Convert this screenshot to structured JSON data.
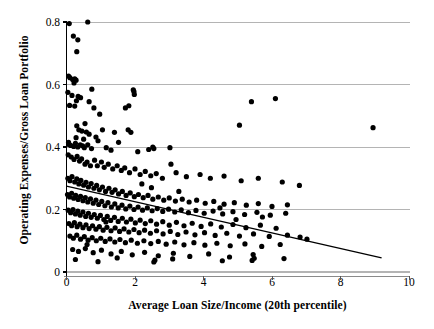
{
  "chart_data": {
    "type": "scatter",
    "title": "",
    "xlabel": "Average Loan Size/Income (20th percentile)",
    "ylabel": "Operating Expenses/Gross Loan Portfolio",
    "xlim": [
      0,
      10
    ],
    "ylim": [
      0,
      0.8
    ],
    "xticks": [
      0,
      2,
      4,
      6,
      8,
      10
    ],
    "xtick_labels": [
      "0",
      "2",
      "4",
      "6",
      "8",
      "10"
    ],
    "yticks": [
      0,
      0.2,
      0.4,
      0.6,
      0.8
    ],
    "ytick_labels": [
      "0",
      "0.2",
      "0.4",
      "0.6",
      "0.8"
    ],
    "grid": "horizontal",
    "grid_color": "#b4b4b4",
    "axis_color": "#000000",
    "marker_color": "#000000",
    "marker_size": 2.6,
    "legend": null,
    "trendline": {
      "label": "linear fit",
      "color": "#000000",
      "x_start": 0.0,
      "y_start": 0.275,
      "x_end": 9.2,
      "y_end": 0.045
    },
    "points": [
      [
        0.08,
        0.795
      ],
      [
        0.62,
        0.8
      ],
      [
        0.2,
        0.755
      ],
      [
        0.33,
        0.743
      ],
      [
        0.3,
        0.705
      ],
      [
        0.06,
        0.627
      ],
      [
        0.1,
        0.622
      ],
      [
        0.18,
        0.616
      ],
      [
        0.24,
        0.618
      ],
      [
        0.28,
        0.614
      ],
      [
        0.22,
        0.605
      ],
      [
        0.04,
        0.575
      ],
      [
        0.16,
        0.565
      ],
      [
        0.34,
        0.562
      ],
      [
        0.41,
        0.558
      ],
      [
        0.29,
        0.548
      ],
      [
        0.09,
        0.533
      ],
      [
        0.24,
        0.531
      ],
      [
        0.74,
        0.585
      ],
      [
        1.95,
        0.583
      ],
      [
        1.97,
        0.577
      ],
      [
        1.98,
        0.568
      ],
      [
        0.66,
        0.545
      ],
      [
        0.8,
        0.525
      ],
      [
        1.72,
        0.525
      ],
      [
        1.82,
        0.532
      ],
      [
        0.97,
        0.505
      ],
      [
        0.54,
        0.475
      ],
      [
        0.3,
        0.468
      ],
      [
        0.36,
        0.455
      ],
      [
        0.45,
        0.451
      ],
      [
        0.58,
        0.448
      ],
      [
        0.66,
        0.441
      ],
      [
        0.86,
        0.432
      ],
      [
        0.28,
        0.43
      ],
      [
        0.5,
        0.425
      ],
      [
        1.05,
        0.455
      ],
      [
        1.4,
        0.447
      ],
      [
        1.8,
        0.455
      ],
      [
        1.88,
        0.447
      ],
      [
        0.06,
        0.415
      ],
      [
        0.07,
        0.408
      ],
      [
        0.12,
        0.405
      ],
      [
        0.21,
        0.402
      ],
      [
        0.26,
        0.412
      ],
      [
        0.33,
        0.4
      ],
      [
        0.4,
        0.407
      ],
      [
        0.47,
        0.404
      ],
      [
        0.52,
        0.398
      ],
      [
        0.62,
        0.407
      ],
      [
        0.73,
        0.395
      ],
      [
        0.92,
        0.42
      ],
      [
        1.16,
        0.398
      ],
      [
        1.3,
        0.39
      ],
      [
        1.52,
        0.415
      ],
      [
        2.08,
        0.385
      ],
      [
        2.4,
        0.392
      ],
      [
        2.52,
        0.4
      ],
      [
        2.55,
        0.395
      ],
      [
        3.02,
        0.398
      ],
      [
        3.05,
        0.345
      ],
      [
        5.05,
        0.47
      ],
      [
        5.4,
        0.545
      ],
      [
        6.1,
        0.555
      ],
      [
        8.95,
        0.462
      ],
      [
        0.05,
        0.375
      ],
      [
        0.14,
        0.368
      ],
      [
        0.22,
        0.36
      ],
      [
        0.31,
        0.37
      ],
      [
        0.38,
        0.355
      ],
      [
        0.44,
        0.362
      ],
      [
        0.54,
        0.345
      ],
      [
        0.6,
        0.352
      ],
      [
        0.7,
        0.34
      ],
      [
        0.82,
        0.358
      ],
      [
        0.9,
        0.34
      ],
      [
        1.02,
        0.352
      ],
      [
        1.1,
        0.335
      ],
      [
        1.22,
        0.345
      ],
      [
        1.35,
        0.33
      ],
      [
        1.48,
        0.34
      ],
      [
        1.6,
        0.325
      ],
      [
        1.7,
        0.333
      ],
      [
        1.84,
        0.318
      ],
      [
        2.0,
        0.33
      ],
      [
        2.15,
        0.312
      ],
      [
        2.3,
        0.322
      ],
      [
        2.46,
        0.308
      ],
      [
        2.62,
        0.315
      ],
      [
        2.8,
        0.3
      ],
      [
        3.2,
        0.318
      ],
      [
        3.5,
        0.305
      ],
      [
        3.9,
        0.312
      ],
      [
        4.2,
        0.3
      ],
      [
        4.6,
        0.307
      ],
      [
        5.1,
        0.292
      ],
      [
        5.6,
        0.3
      ],
      [
        6.3,
        0.288
      ],
      [
        6.8,
        0.277
      ],
      [
        0.04,
        0.3
      ],
      [
        0.1,
        0.292
      ],
      [
        0.16,
        0.305
      ],
      [
        0.24,
        0.288
      ],
      [
        0.3,
        0.298
      ],
      [
        0.36,
        0.282
      ],
      [
        0.42,
        0.293
      ],
      [
        0.5,
        0.278
      ],
      [
        0.57,
        0.287
      ],
      [
        0.64,
        0.272
      ],
      [
        0.72,
        0.283
      ],
      [
        0.8,
        0.268
      ],
      [
        0.88,
        0.277
      ],
      [
        0.96,
        0.263
      ],
      [
        1.05,
        0.272
      ],
      [
        1.14,
        0.258
      ],
      [
        1.24,
        0.268
      ],
      [
        1.33,
        0.255
      ],
      [
        1.42,
        0.263
      ],
      [
        1.52,
        0.25
      ],
      [
        1.63,
        0.258
      ],
      [
        1.74,
        0.245
      ],
      [
        1.86,
        0.253
      ],
      [
        1.98,
        0.241
      ],
      [
        2.1,
        0.248
      ],
      [
        2.24,
        0.238
      ],
      [
        2.38,
        0.245
      ],
      [
        2.52,
        0.233
      ],
      [
        2.68,
        0.24
      ],
      [
        2.84,
        0.23
      ],
      [
        3.0,
        0.237
      ],
      [
        3.18,
        0.227
      ],
      [
        3.38,
        0.233
      ],
      [
        3.58,
        0.224
      ],
      [
        3.8,
        0.23
      ],
      [
        4.05,
        0.22
      ],
      [
        4.3,
        0.226
      ],
      [
        4.6,
        0.217
      ],
      [
        4.9,
        0.222
      ],
      [
        5.25,
        0.214
      ],
      [
        5.6,
        0.219
      ],
      [
        6.0,
        0.21
      ],
      [
        6.45,
        0.215
      ],
      [
        0.03,
        0.248
      ],
      [
        0.09,
        0.24
      ],
      [
        0.15,
        0.252
      ],
      [
        0.21,
        0.236
      ],
      [
        0.27,
        0.245
      ],
      [
        0.34,
        0.232
      ],
      [
        0.41,
        0.242
      ],
      [
        0.48,
        0.228
      ],
      [
        0.55,
        0.238
      ],
      [
        0.62,
        0.224
      ],
      [
        0.7,
        0.234
      ],
      [
        0.78,
        0.22
      ],
      [
        0.86,
        0.23
      ],
      [
        0.94,
        0.216
      ],
      [
        1.03,
        0.226
      ],
      [
        1.12,
        0.212
      ],
      [
        1.21,
        0.222
      ],
      [
        1.31,
        0.208
      ],
      [
        1.41,
        0.218
      ],
      [
        1.51,
        0.205
      ],
      [
        1.62,
        0.214
      ],
      [
        1.73,
        0.202
      ],
      [
        1.85,
        0.211
      ],
      [
        1.97,
        0.2
      ],
      [
        2.09,
        0.208
      ],
      [
        2.22,
        0.198
      ],
      [
        2.36,
        0.205
      ],
      [
        2.5,
        0.196
      ],
      [
        2.65,
        0.203
      ],
      [
        2.81,
        0.194
      ],
      [
        2.98,
        0.201
      ],
      [
        3.16,
        0.192
      ],
      [
        3.35,
        0.199
      ],
      [
        3.56,
        0.19
      ],
      [
        3.78,
        0.197
      ],
      [
        4.02,
        0.188
      ],
      [
        4.28,
        0.195
      ],
      [
        4.56,
        0.186
      ],
      [
        4.86,
        0.193
      ],
      [
        5.2,
        0.184
      ],
      [
        5.56,
        0.191
      ],
      [
        5.95,
        0.182
      ],
      [
        6.4,
        0.188
      ],
      [
        0.05,
        0.198
      ],
      [
        0.12,
        0.19
      ],
      [
        0.19,
        0.2
      ],
      [
        0.26,
        0.186
      ],
      [
        0.33,
        0.195
      ],
      [
        0.4,
        0.182
      ],
      [
        0.48,
        0.192
      ],
      [
        0.56,
        0.178
      ],
      [
        0.64,
        0.188
      ],
      [
        0.72,
        0.175
      ],
      [
        0.81,
        0.184
      ],
      [
        0.9,
        0.172
      ],
      [
        0.99,
        0.181
      ],
      [
        1.09,
        0.168
      ],
      [
        1.19,
        0.178
      ],
      [
        1.29,
        0.165
      ],
      [
        1.4,
        0.175
      ],
      [
        1.51,
        0.162
      ],
      [
        1.63,
        0.172
      ],
      [
        1.75,
        0.16
      ],
      [
        1.88,
        0.169
      ],
      [
        2.01,
        0.157
      ],
      [
        2.15,
        0.166
      ],
      [
        2.3,
        0.155
      ],
      [
        2.46,
        0.164
      ],
      [
        2.63,
        0.153
      ],
      [
        2.81,
        0.161
      ],
      [
        3.0,
        0.15
      ],
      [
        3.21,
        0.159
      ],
      [
        3.43,
        0.148
      ],
      [
        3.67,
        0.156
      ],
      [
        3.93,
        0.146
      ],
      [
        4.21,
        0.154
      ],
      [
        4.52,
        0.144
      ],
      [
        4.86,
        0.152
      ],
      [
        5.24,
        0.142
      ],
      [
        5.66,
        0.15
      ],
      [
        6.12,
        0.14
      ],
      [
        0.07,
        0.155
      ],
      [
        0.15,
        0.148
      ],
      [
        0.23,
        0.158
      ],
      [
        0.31,
        0.145
      ],
      [
        0.39,
        0.153
      ],
      [
        0.48,
        0.142
      ],
      [
        0.57,
        0.151
      ],
      [
        0.66,
        0.139
      ],
      [
        0.76,
        0.148
      ],
      [
        0.86,
        0.137
      ],
      [
        0.96,
        0.145
      ],
      [
        1.07,
        0.134
      ],
      [
        1.18,
        0.143
      ],
      [
        1.3,
        0.132
      ],
      [
        1.42,
        0.141
      ],
      [
        1.55,
        0.13
      ],
      [
        1.68,
        0.138
      ],
      [
        1.82,
        0.128
      ],
      [
        1.97,
        0.136
      ],
      [
        2.12,
        0.126
      ],
      [
        2.28,
        0.134
      ],
      [
        2.45,
        0.124
      ],
      [
        2.63,
        0.132
      ],
      [
        2.82,
        0.122
      ],
      [
        3.03,
        0.13
      ],
      [
        3.25,
        0.12
      ],
      [
        3.49,
        0.128
      ],
      [
        3.75,
        0.119
      ],
      [
        4.03,
        0.126
      ],
      [
        4.34,
        0.117
      ],
      [
        4.68,
        0.124
      ],
      [
        5.05,
        0.115
      ],
      [
        5.46,
        0.122
      ],
      [
        5.92,
        0.114
      ],
      [
        0.1,
        0.115
      ],
      [
        0.2,
        0.108
      ],
      [
        0.3,
        0.118
      ],
      [
        0.41,
        0.105
      ],
      [
        0.52,
        0.113
      ],
      [
        0.63,
        0.102
      ],
      [
        0.75,
        0.11
      ],
      [
        0.87,
        0.1
      ],
      [
        1.0,
        0.108
      ],
      [
        1.13,
        0.098
      ],
      [
        1.27,
        0.106
      ],
      [
        1.41,
        0.096
      ],
      [
        1.56,
        0.104
      ],
      [
        1.72,
        0.094
      ],
      [
        1.89,
        0.102
      ],
      [
        2.07,
        0.092
      ],
      [
        2.26,
        0.1
      ],
      [
        2.46,
        0.091
      ],
      [
        2.68,
        0.098
      ],
      [
        2.91,
        0.089
      ],
      [
        3.16,
        0.096
      ],
      [
        3.43,
        0.087
      ],
      [
        3.72,
        0.094
      ],
      [
        4.04,
        0.086
      ],
      [
        4.39,
        0.092
      ],
      [
        4.78,
        0.084
      ],
      [
        5.21,
        0.09
      ],
      [
        5.7,
        0.082
      ],
      [
        6.24,
        0.088
      ],
      [
        0.18,
        0.072
      ],
      [
        0.35,
        0.066
      ],
      [
        0.55,
        0.075
      ],
      [
        0.78,
        0.062
      ],
      [
        1.02,
        0.07
      ],
      [
        1.3,
        0.058
      ],
      [
        1.6,
        0.066
      ],
      [
        1.92,
        0.055
      ],
      [
        2.28,
        0.063
      ],
      [
        2.68,
        0.052
      ],
      [
        3.12,
        0.06
      ],
      [
        3.6,
        0.05
      ],
      [
        4.15,
        0.058
      ],
      [
        4.76,
        0.048
      ],
      [
        5.45,
        0.056
      ],
      [
        0.26,
        0.04
      ],
      [
        0.92,
        0.033
      ],
      [
        1.48,
        0.045
      ],
      [
        2.55,
        0.032
      ],
      [
        2.58,
        0.038
      ],
      [
        3.1,
        0.042
      ],
      [
        4.55,
        0.036
      ],
      [
        5.42,
        0.037
      ],
      [
        5.48,
        0.044
      ],
      [
        6.35,
        0.043
      ],
      [
        0.6,
        0.088
      ],
      [
        1.15,
        0.16
      ],
      [
        2.2,
        0.282
      ],
      [
        2.48,
        0.27
      ],
      [
        3.28,
        0.258
      ],
      [
        4.48,
        0.205
      ],
      [
        4.95,
        0.168
      ],
      [
        5.72,
        0.176
      ],
      [
        6.45,
        0.118
      ],
      [
        6.82,
        0.112
      ],
      [
        7.02,
        0.105
      ]
    ]
  }
}
